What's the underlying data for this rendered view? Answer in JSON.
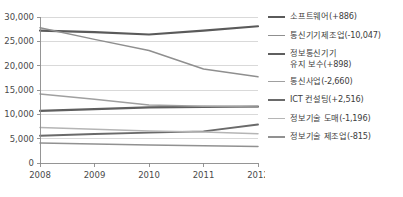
{
  "chart_data": {
    "type": "line",
    "title": "",
    "xlabel": "",
    "ylabel": "",
    "x": [
      "2008",
      "2009",
      "2010",
      "2011",
      "2012"
    ],
    "categories": [
      "2008",
      "2009",
      "2010",
      "2011",
      "2012"
    ],
    "ylim": [
      0,
      30000
    ],
    "xlim": [
      "2008",
      "2012"
    ],
    "y_ticks": [
      0,
      5000,
      10000,
      15000,
      20000,
      25000,
      30000
    ],
    "y_tick_labels": [
      "0",
      "5,000",
      "10,000",
      "15,000",
      "20,000",
      "25,000",
      "30,000"
    ],
    "x_tick_labels": [
      "2008",
      "2009",
      "2010",
      "2011",
      "2012"
    ],
    "grid": true,
    "grid_axis": "y",
    "legend_position": "right",
    "series": [
      {
        "name": "소프트웨어(+886)",
        "label": "소프트웨어(+886)",
        "delta": 886,
        "color": "#5a5a5a",
        "width": 2.2,
        "values": [
          27200,
          26900,
          26400,
          27200,
          28100
        ]
      },
      {
        "name": "통신기기제조업(-10,047)",
        "label": "통신기기제조업(-10,047)",
        "delta": -10047,
        "color": "#8f8f8f",
        "width": 1.5,
        "values": [
          27800,
          25400,
          23100,
          19300,
          17700
        ]
      },
      {
        "name": "정보통신기기\n유지 보수(+898)",
        "label": "정보통신기기\n유지 보수(+898)",
        "delta": 898,
        "color": "#5f5f5f",
        "width": 2.2,
        "values": [
          10700,
          11050,
          11450,
          11550,
          11600
        ]
      },
      {
        "name": "통신사업(-2,660)",
        "label": "통신사업(-2,660)",
        "delta": -2660,
        "color": "#a0a0a0",
        "width": 1.5,
        "values": [
          14200,
          13100,
          11900,
          11650,
          11500
        ]
      },
      {
        "name": "ICT 컨설팅(+2,516)",
        "label": "ICT 컨설팅(+2,516)",
        "delta": 2516,
        "color": "#6a6a6a",
        "width": 1.9,
        "values": [
          5600,
          5950,
          6250,
          6500,
          7900
        ]
      },
      {
        "name": "정보기술 도매(-1,196)",
        "label": "정보기술 도매(-1,196)",
        "delta": -1196,
        "color": "#b5b5b5",
        "width": 1.5,
        "values": [
          7300,
          6950,
          6600,
          6350,
          6000
        ]
      },
      {
        "name": "정보기술 제조업(-815)",
        "label": "정보기술 제조업(-815)",
        "delta": -815,
        "color": "#919191",
        "width": 1.5,
        "values": [
          4100,
          3900,
          3700,
          3550,
          3400
        ]
      }
    ]
  },
  "colors": {
    "background": "#ffffff",
    "gridline": "#c9c9c9",
    "axis": "#8a8a8a",
    "text": "#3d3d3d"
  }
}
